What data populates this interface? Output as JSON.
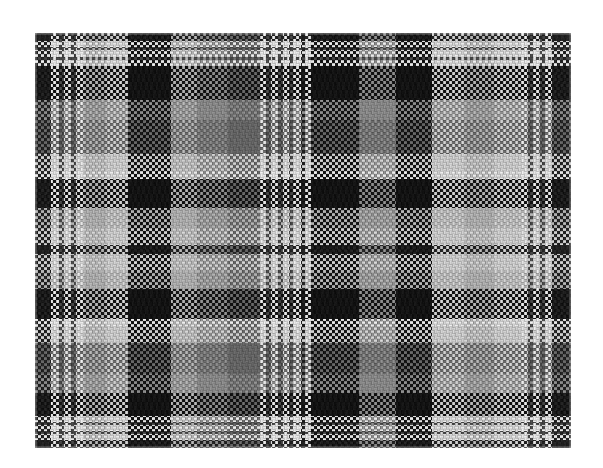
{
  "image": {
    "title": "Woven Tartan Plaid Fabric Swatch",
    "type": "textile-photograph",
    "width": 603,
    "height": 468,
    "background_color": "#ffffff",
    "alt_text": "Greyscale woven checked plaid fabric swatch on white background"
  },
  "swatch": {
    "name": "fabric-swatch",
    "left": 35,
    "top": 33,
    "width": 536,
    "height": 415,
    "weave": {
      "type": "plain-weave-checkerboard",
      "cell_px": 3,
      "thread_count_warp": 179,
      "thread_count_weft": 139,
      "description": "Fine 3px checkerboard interlacing of warp and weft threads producing a halftone texture"
    }
  },
  "palette": {
    "white": "#e9e9e9",
    "light": "#d2d2d2",
    "mid_light": "#b4b4b4",
    "mid": "#8e8e8e",
    "mid_dark": "#6a6a6a",
    "dark": "#4a4a4a",
    "black": "#232323",
    "deep_black": "#141414",
    "background": "#ffffff"
  },
  "chart_data": {
    "type": "heatmap",
    "xlabel": "Warp stripe sequence (px width)",
    "ylabel": "Weft stripe sequence (px height)",
    "grid": false,
    "legend": "none",
    "tone_levels": {
      "W": "#e9e9e9",
      "L": "#d2d2d2",
      "M": "#b4b4b4",
      "G": "#8e8e8e",
      "D": "#6a6a6a",
      "K": "#4a4a4a",
      "B": "#232323",
      "X": "#141414"
    },
    "warp_sett": [
      {
        "tone": "B",
        "width": 13
      },
      {
        "tone": "W",
        "width": 7
      },
      {
        "tone": "K",
        "width": 4
      },
      {
        "tone": "W",
        "width": 6
      },
      {
        "tone": "K",
        "width": 4
      },
      {
        "tone": "W",
        "width": 7
      },
      {
        "tone": "M",
        "width": 18
      },
      {
        "tone": "L",
        "width": 18
      },
      {
        "tone": "X",
        "width": 36
      },
      {
        "tone": "M",
        "width": 22
      },
      {
        "tone": "G",
        "width": 26
      },
      {
        "tone": "D",
        "width": 26
      },
      {
        "tone": "W",
        "width": 5
      },
      {
        "tone": "K",
        "width": 4
      },
      {
        "tone": "W",
        "width": 6
      },
      {
        "tone": "K",
        "width": 4
      },
      {
        "tone": "W",
        "width": 5
      },
      {
        "tone": "K",
        "width": 4
      },
      {
        "tone": "W",
        "width": 6
      },
      {
        "tone": "B",
        "width": 4
      },
      {
        "tone": "W",
        "width": 5
      },
      {
        "tone": "X",
        "width": 40
      },
      {
        "tone": "G",
        "width": 30
      },
      {
        "tone": "X",
        "width": 30
      },
      {
        "tone": "L",
        "width": 28
      },
      {
        "tone": "M",
        "width": 24
      },
      {
        "tone": "L",
        "width": 22
      },
      {
        "tone": "W",
        "width": 6
      },
      {
        "tone": "K",
        "width": 4
      },
      {
        "tone": "W",
        "width": 6
      },
      {
        "tone": "K",
        "width": 4
      },
      {
        "tone": "W",
        "width": 6
      },
      {
        "tone": "B",
        "width": 16
      }
    ],
    "weft_sett": [
      {
        "tone": "B",
        "height": 11
      },
      {
        "tone": "W",
        "height": 7
      },
      {
        "tone": "K",
        "height": 4
      },
      {
        "tone": "W",
        "height": 9
      },
      {
        "tone": "K",
        "height": 4
      },
      {
        "tone": "W",
        "height": 8
      },
      {
        "tone": "X",
        "height": 44
      },
      {
        "tone": "G",
        "height": 26
      },
      {
        "tone": "D",
        "height": 44
      },
      {
        "tone": "L",
        "height": 22
      },
      {
        "tone": "W",
        "height": 10
      },
      {
        "tone": "X",
        "height": 38
      },
      {
        "tone": "M",
        "height": 26
      },
      {
        "tone": "L",
        "height": 22
      },
      {
        "tone": "B",
        "height": 12
      },
      {
        "tone": "L",
        "height": 22
      },
      {
        "tone": "M",
        "height": 24
      },
      {
        "tone": "X",
        "height": 38
      },
      {
        "tone": "W",
        "height": 10
      },
      {
        "tone": "L",
        "height": 22
      },
      {
        "tone": "D",
        "height": 40
      },
      {
        "tone": "G",
        "height": 24
      },
      {
        "tone": "X",
        "height": 30
      },
      {
        "tone": "W",
        "height": 8
      },
      {
        "tone": "K",
        "height": 4
      },
      {
        "tone": "W",
        "height": 8
      },
      {
        "tone": "K",
        "height": 4
      },
      {
        "tone": "W",
        "height": 7
      },
      {
        "tone": "B",
        "height": 11
      }
    ]
  }
}
